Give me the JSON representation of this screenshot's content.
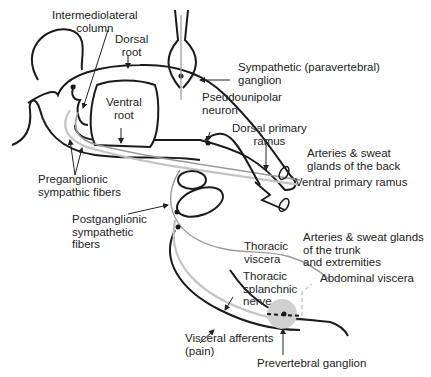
{
  "diagram": {
    "labels": {
      "intermediolateral_column": "Intermediolateral\ncolumn",
      "dorsal_root": "Dorsal\nroot",
      "ventral_root": "Ventral\nroot",
      "sympathetic_ganglion": "Sympathetic (paravertebral)\nganglion",
      "pseudounipolar_neuron": "Pseudounipolar\nneuron",
      "dorsal_primary_ramus": "Dorsal primary\nramus",
      "arteries_back": "Arteries & sweat\nglands of the back",
      "ventral_primary_ramus": "Ventral primary ramus",
      "preganglionic": "Preganglionic\nsympathic fibers",
      "postganglionic": "Postganglionic\nsympathetic\nfibers",
      "arteries_trunk": "Arteries & sweat glands\nof the trunk\nand extremities",
      "thoracic_viscera": "Thoracic\nviscera",
      "thoracic_splanchnic": "Thoracic\nsplanchnic\nnerve",
      "abdominal_viscera": "Abdominal viscera",
      "visceral_afferents": "Visceral afferents\n(pain)",
      "prevertebral_ganglion": "Prevertebral ganglion"
    },
    "colors": {
      "outline": "#1a1a1a",
      "fiber_gray": "#9a9a9a",
      "fiber_light": "#c4c4c4",
      "ganglion_fill": "#d0d0d0"
    }
  }
}
